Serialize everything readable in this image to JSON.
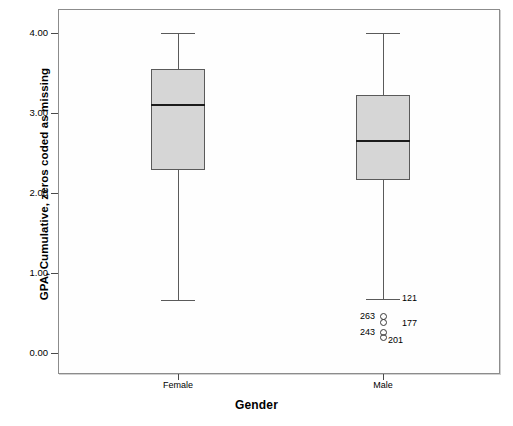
{
  "chart_data": {
    "type": "box",
    "title": "",
    "xlabel": "Gender",
    "ylabel": "GPA, Cumulative, zeros coded as missing",
    "categories": [
      "Female",
      "Male"
    ],
    "ylim": [
      0.0,
      4.2
    ],
    "yticks": [
      0.0,
      1.0,
      2.0,
      3.0,
      4.0
    ],
    "ytick_labels": [
      "0.00",
      "1.00",
      "2.00",
      "3.00",
      "4.00"
    ],
    "grid": false,
    "legend": "none",
    "boxes": [
      {
        "category": "Female",
        "whisker_low": 0.66,
        "q1": 2.29,
        "median": 3.1,
        "q3": 3.55,
        "whisker_high": 4.0,
        "outliers": []
      },
      {
        "category": "Male",
        "whisker_low": 0.67,
        "q1": 2.16,
        "median": 2.65,
        "q3": 3.22,
        "whisker_high": 4.0,
        "outliers": [
          {
            "label": "263",
            "value": 0.46,
            "label_side": "left"
          },
          {
            "label": "177",
            "value": 0.38,
            "label_side": "right-far"
          },
          {
            "label": "243",
            "value": 0.26,
            "label_side": "left"
          },
          {
            "label": "201",
            "value": 0.2,
            "label_side": "right"
          }
        ],
        "whisker_low_label": "121"
      }
    ],
    "box_fill_color": "#d6d6d6",
    "box_border_color": "#5a5a5a",
    "median_color": "#1c1c1c",
    "frame_color": "#8c8c8c",
    "background_color": "#ffffff"
  }
}
